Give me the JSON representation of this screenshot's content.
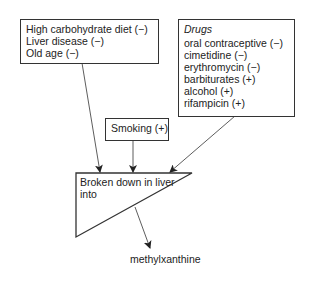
{
  "factors_box": {
    "lines": [
      "High carbohydrate diet (−)",
      "Liver disease (−)",
      "Old age (−)"
    ]
  },
  "drugs_box": {
    "title": "Drugs",
    "lines": [
      "oral contraceptive (−)",
      "cimetidine (−)",
      "erythromycin (−)",
      "barbiturates (+)",
      "alcohol (+)",
      "rifampicin (+)"
    ]
  },
  "smoking_box": {
    "label": "Smoking (+)"
  },
  "liver_triangle": {
    "lines": [
      "Broken down in liver",
      "into"
    ]
  },
  "product": {
    "label": "methylxanthine"
  }
}
